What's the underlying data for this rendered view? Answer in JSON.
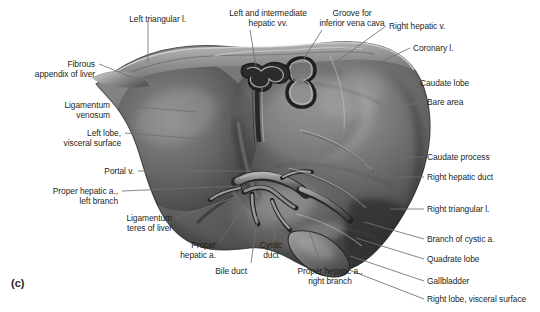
{
  "figure": {
    "caption_letter": "(c)",
    "style": "grayscale-anatomical-illustration",
    "background_color": "#ffffff",
    "text_color": "#231f20",
    "leader_color": "#6f6f6f"
  },
  "labels": [
    {
      "id": "left-triangular-l",
      "text": "Left triangular l.",
      "align": "right",
      "x": 186,
      "y": 14,
      "lines": [
        "Left triangular l."
      ]
    },
    {
      "id": "left-and-intermediate-hepatic-vv",
      "text": "Left and intermediate\nhepatic vv.",
      "align": "center",
      "x": 268,
      "y": 8,
      "lines": [
        "Left and intermediate",
        "hepatic vv."
      ]
    },
    {
      "id": "groove-for-inferior-vena-cava",
      "text": "Groove for\ninferior vena cava",
      "align": "center",
      "x": 352,
      "y": 8,
      "lines": [
        "Groove for",
        "inferior vena cava"
      ]
    },
    {
      "id": "right-hepatic-v",
      "text": "Right hepatic v.",
      "align": "left",
      "x": 389,
      "y": 21,
      "lines": [
        "Right hepatic v."
      ]
    },
    {
      "id": "coronary-l",
      "text": "Coronary l.",
      "align": "left",
      "x": 413,
      "y": 43,
      "lines": [
        "Coronary l."
      ]
    },
    {
      "id": "caudate-lobe",
      "text": "Caudate lobe",
      "align": "left",
      "x": 420,
      "y": 78,
      "lines": [
        "Caudate lobe"
      ]
    },
    {
      "id": "bare-area",
      "text": "Bare area",
      "align": "left",
      "x": 427,
      "y": 97,
      "lines": [
        "Bare area"
      ]
    },
    {
      "id": "caudate-process",
      "text": "Caudate process",
      "align": "left",
      "x": 427,
      "y": 152,
      "lines": [
        "Caudate process"
      ]
    },
    {
      "id": "right-hepatic-duct",
      "text": "Right hepatic duct",
      "align": "left",
      "x": 427,
      "y": 172,
      "lines": [
        "Right hepatic duct"
      ]
    },
    {
      "id": "right-triangular-l",
      "text": "Right triangular l.",
      "align": "left",
      "x": 427,
      "y": 204,
      "lines": [
        "Right triangular l."
      ]
    },
    {
      "id": "branch-of-cystic-a",
      "text": "Branch of cystic a.",
      "align": "left",
      "x": 427,
      "y": 234,
      "lines": [
        "Branch of cystic a."
      ]
    },
    {
      "id": "quadrate-lobe",
      "text": "Quadrate lobe",
      "align": "left",
      "x": 427,
      "y": 254,
      "lines": [
        "Quadrate lobe"
      ]
    },
    {
      "id": "gallbladder",
      "text": "Gallbladder",
      "align": "left",
      "x": 427,
      "y": 276,
      "lines": [
        "Gallbladder"
      ]
    },
    {
      "id": "right-lobe-visceral-surface",
      "text": "Right lobe, visceral surface",
      "align": "left",
      "x": 427,
      "y": 294,
      "lines": [
        "Right lobe, visceral surface"
      ]
    },
    {
      "id": "fibrous-appendix-of-liver",
      "text": "Fibrous\nappendix of liver",
      "align": "right",
      "x": 95,
      "y": 59,
      "lines": [
        "Fibrous",
        "appendix of liver"
      ]
    },
    {
      "id": "ligamentum-venosum",
      "text": "Ligamentum\nvenosum",
      "align": "right",
      "x": 110,
      "y": 100,
      "lines": [
        "Ligamentum",
        "venosum"
      ]
    },
    {
      "id": "left-lobe-visceral-surface",
      "text": "Left lobe,\nvisceral surface",
      "align": "right",
      "x": 121,
      "y": 128,
      "lines": [
        "Left lobe,",
        "visceral surface"
      ]
    },
    {
      "id": "portal-v",
      "text": "Portal v.",
      "align": "right",
      "x": 134,
      "y": 166,
      "lines": [
        "Portal v."
      ]
    },
    {
      "id": "proper-hepatic-a-left-branch",
      "text": "Proper hepatic a.,\nleft branch",
      "align": "right",
      "x": 118,
      "y": 186,
      "lines": [
        "Proper hepatic a.,",
        "left branch"
      ]
    },
    {
      "id": "ligamentum-teres-of-liver",
      "text": "Ligamentum\nteres of liver",
      "align": "right",
      "x": 172,
      "y": 213,
      "lines": [
        "Ligamentum",
        "teres of liver"
      ]
    },
    {
      "id": "proper-hepatic-a",
      "text": "Proper\nhepatic a.",
      "align": "right",
      "x": 216,
      "y": 240,
      "lines": [
        "Proper",
        "hepatic a."
      ]
    },
    {
      "id": "bile-duct",
      "text": "Bile duct",
      "align": "right",
      "x": 247,
      "y": 266,
      "lines": [
        "Bile duct"
      ]
    },
    {
      "id": "cystic-duct",
      "text": "Cystic\nduct",
      "align": "center",
      "x": 271,
      "y": 240,
      "lines": [
        "Cystic",
        "duct"
      ]
    },
    {
      "id": "proper-hepatic-a-right-branch",
      "text": "Proper hepatic a.,\nright branch",
      "align": "center",
      "x": 330,
      "y": 266,
      "lines": [
        "Proper hepatic a.,",
        "right branch"
      ]
    }
  ]
}
